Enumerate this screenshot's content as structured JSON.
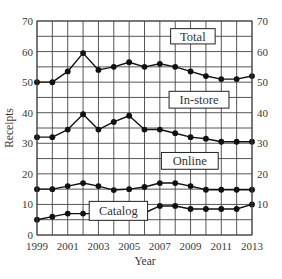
{
  "chart_data": {
    "type": "line",
    "title": "",
    "xlabel": "Year",
    "ylabel": "Receipts",
    "x": [
      1999,
      2000,
      2001,
      2002,
      2003,
      2004,
      2005,
      2006,
      2007,
      2008,
      2009,
      2010,
      2011,
      2012,
      2013
    ],
    "x_tick_labels": [
      "1999",
      "2001",
      "2003",
      "2005",
      "2007",
      "2009",
      "2011",
      "2013"
    ],
    "y_tick_labels": [
      "0",
      "10",
      "20",
      "30",
      "40",
      "50",
      "60",
      "70"
    ],
    "right_y_tick_labels": [
      "10",
      "20",
      "30",
      "40",
      "50",
      "60",
      "70"
    ],
    "xlim": [
      1999,
      2013
    ],
    "ylim": [
      0,
      70
    ],
    "grid": true,
    "grid_y_step": 5,
    "grid_x_step": 1,
    "legend_position": "inline boxed labels",
    "series": [
      {
        "name": "Total",
        "values": [
          50,
          50,
          53.5,
          59.5,
          54,
          55,
          56.5,
          55,
          56,
          55,
          53.5,
          52,
          51,
          51,
          52
        ],
        "label_box": {
          "x": 2007.7,
          "y": 62.5,
          "w": 2.9,
          "h": 5
        }
      },
      {
        "name": "In-store",
        "values": [
          32,
          32,
          34.5,
          39.5,
          34.5,
          37,
          39,
          34.5,
          34.5,
          33.3,
          32,
          31.5,
          30.5,
          30.5,
          30.5
        ],
        "label_box": {
          "x": 2007.6,
          "y": 41.5,
          "w": 3.9,
          "h": 5.5
        }
      },
      {
        "name": "Online",
        "values": [
          15,
          15,
          16,
          17,
          16,
          14.7,
          15,
          15.7,
          17,
          17,
          16,
          14.8,
          14.8,
          14.8,
          14.8
        ],
        "label_box": {
          "x": 2007.1,
          "y": 21.5,
          "w": 3.7,
          "h": 5.5
        }
      },
      {
        "name": "Catalog",
        "values": [
          5,
          6,
          7,
          7,
          7,
          7,
          7,
          7.2,
          9.5,
          9.5,
          8.5,
          8.5,
          8.5,
          8.5,
          10
        ],
        "label_box": {
          "x": 2002.4,
          "y": 4.8,
          "w": 3.8,
          "h": 6.2
        }
      }
    ]
  },
  "colors": {
    "line": "#111111",
    "grid": "#444444",
    "text": "#3a3a3a",
    "background": "#ffffff"
  }
}
